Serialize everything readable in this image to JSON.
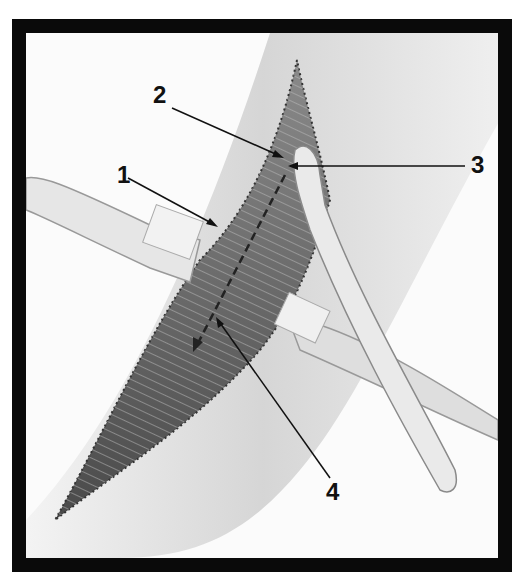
{
  "figure": {
    "type": "surgical-illustration",
    "colors": {
      "frame": "#0a0a0a",
      "background": "#fbfbfb",
      "skin": "#d8d8d8",
      "muscle": "#6e6e6e",
      "instrument": "#e8e8e8"
    }
  },
  "labels": [
    {
      "id": "1",
      "text": "1"
    },
    {
      "id": "2",
      "text": "2"
    },
    {
      "id": "3",
      "text": "3"
    },
    {
      "id": "4",
      "text": "4"
    }
  ]
}
